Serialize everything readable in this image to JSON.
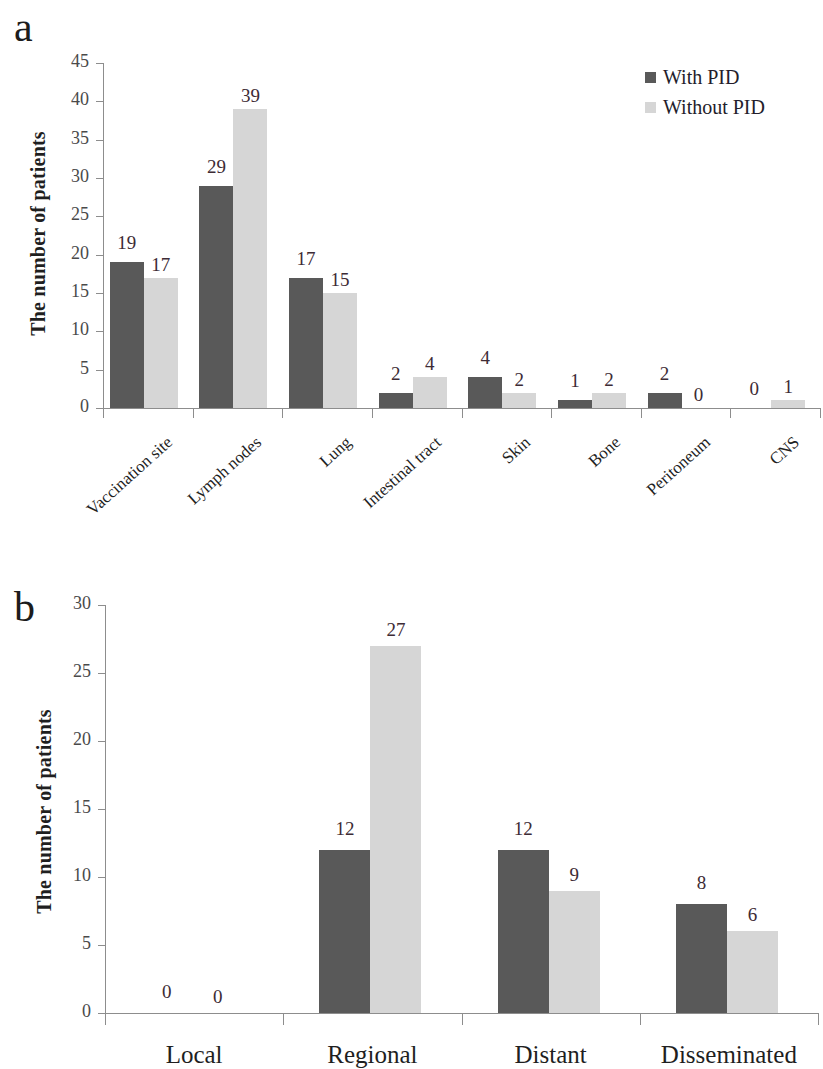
{
  "figure": {
    "background": "#ffffff",
    "bar_color_dark": "#595959",
    "bar_color_light": "#d6d6d6"
  },
  "panel_a": {
    "letter": "a",
    "ylabel": "The number of patients",
    "legend": [
      {
        "label": "With PID",
        "color": "#595959"
      },
      {
        "label": "Without PID",
        "color": "#d6d6d6"
      }
    ]
  },
  "panel_b": {
    "letter": "b",
    "ylabel": "The number of patients"
  },
  "chart_data": [
    {
      "type": "bar",
      "panel": "a",
      "title": "",
      "xlabel": "",
      "ylabel": "The number of patients",
      "ylim": [
        0,
        45
      ],
      "yticks": [
        0,
        5,
        10,
        15,
        20,
        25,
        30,
        35,
        40,
        45
      ],
      "grid": false,
      "legend_position": "top-right",
      "tick_label_rotation": -42,
      "categories": [
        "Vaccination site",
        "Lymph nodes",
        "Lung",
        "Intestinal tract",
        "Skin",
        "Bone",
        "Peritoneum",
        "CNS"
      ],
      "series": [
        {
          "name": "With PID",
          "color": "#595959",
          "values": [
            19,
            29,
            17,
            2,
            4,
            1,
            2,
            0
          ]
        },
        {
          "name": "Without PID",
          "color": "#d6d6d6",
          "values": [
            17,
            39,
            15,
            4,
            2,
            2,
            0,
            1
          ]
        }
      ]
    },
    {
      "type": "bar",
      "panel": "b",
      "title": "",
      "xlabel": "",
      "ylabel": "The number of patients",
      "ylim": [
        0,
        30
      ],
      "yticks": [
        0,
        5,
        10,
        15,
        20,
        25,
        30
      ],
      "grid": false,
      "legend_position": "none",
      "tick_label_rotation": 0,
      "categories": [
        "Local",
        "Regional",
        "Distant",
        "Disseminated"
      ],
      "series": [
        {
          "name": "With PID",
          "color": "#595959",
          "values": [
            0,
            12,
            12,
            8
          ]
        },
        {
          "name": "Without PID",
          "color": "#d6d6d6",
          "values": [
            0,
            27,
            9,
            6
          ]
        }
      ]
    }
  ]
}
